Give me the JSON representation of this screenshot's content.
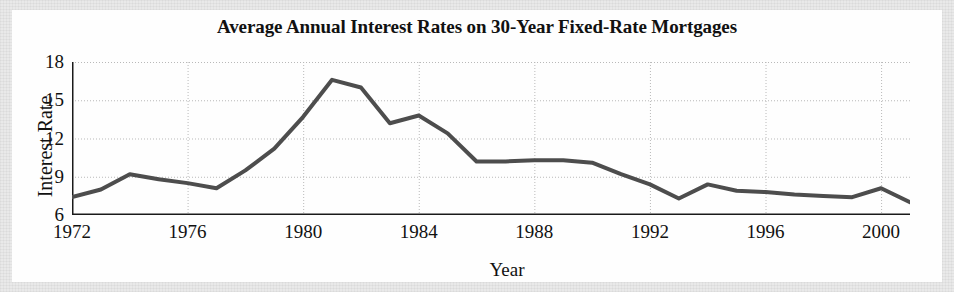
{
  "chart_data": {
    "type": "line",
    "title": "Average Annual Interest Rates on 30-Year Fixed-Rate Mortgages",
    "xlabel": "Year",
    "ylabel": "Interest Rate",
    "xlim": [
      1972,
      2001
    ],
    "ylim": [
      6,
      18
    ],
    "yticks": [
      6,
      9,
      12,
      15,
      18
    ],
    "ytick_labels": [
      "6",
      "9",
      "12",
      "15",
      "18"
    ],
    "xticks": [
      1972,
      1976,
      1980,
      1984,
      1988,
      1992,
      1996,
      2000
    ],
    "xtick_labels": [
      "1972",
      "1976",
      "1980",
      "1984",
      "1988",
      "1992",
      "1996",
      "2000"
    ],
    "x_minor_tick_step": 1,
    "grid": true,
    "grid_style": "dotted",
    "legend": "none",
    "line_color": "#4d4d4d",
    "line_width": 4,
    "x": [
      1972,
      1973,
      1974,
      1975,
      1976,
      1977,
      1978,
      1979,
      1980,
      1981,
      1982,
      1983,
      1984,
      1985,
      1986,
      1987,
      1988,
      1989,
      1990,
      1991,
      1992,
      1993,
      1994,
      1995,
      1996,
      1997,
      1998,
      1999,
      2000,
      2001
    ],
    "values": [
      7.4,
      8.0,
      9.2,
      8.8,
      8.5,
      8.1,
      9.5,
      11.2,
      13.7,
      16.6,
      16.0,
      13.2,
      13.8,
      12.4,
      10.2,
      10.2,
      10.3,
      10.3,
      10.1,
      9.2,
      8.4,
      7.3,
      8.4,
      7.9,
      7.8,
      7.6,
      7.5,
      7.4,
      8.1,
      7.0
    ],
    "series_name": "Average annual 30-year fixed mortgage rate"
  },
  "figure": {
    "background_color": "#e9e9e9",
    "panel_color": "#fefefe"
  }
}
